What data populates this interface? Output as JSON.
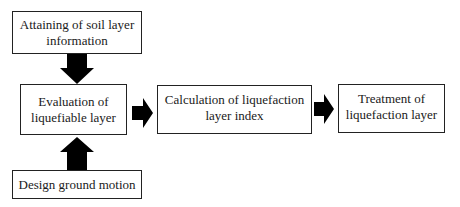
{
  "diagram": {
    "type": "flowchart",
    "nodes": [
      {
        "id": "attaining",
        "lines": [
          "Attaining of soil layer",
          "information"
        ]
      },
      {
        "id": "evaluation",
        "lines": [
          "Evaluation of",
          "liquefiable layer"
        ]
      },
      {
        "id": "design",
        "lines": [
          "Design ground motion"
        ]
      },
      {
        "id": "calculation",
        "lines": [
          "Calculation of liquefaction",
          "layer index"
        ]
      },
      {
        "id": "treatment",
        "lines": [
          "Treatment of",
          "liquefaction layer"
        ]
      }
    ],
    "edges": [
      {
        "from": "attaining",
        "to": "evaluation",
        "direction": "down"
      },
      {
        "from": "design",
        "to": "evaluation",
        "direction": "up"
      },
      {
        "from": "evaluation",
        "to": "calculation",
        "direction": "right"
      },
      {
        "from": "calculation",
        "to": "treatment",
        "direction": "right"
      }
    ],
    "colors": {
      "border": "#222222",
      "arrow": "#000000",
      "background": "#ffffff",
      "text": "#1a1a1a"
    }
  }
}
